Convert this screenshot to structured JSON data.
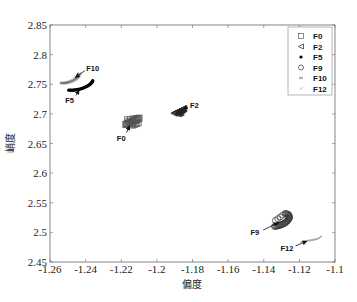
{
  "chart_data": {
    "type": "scatter",
    "title": "",
    "xlabel": "偏度",
    "ylabel": "峭度",
    "xlim": [
      -1.26,
      -1.1
    ],
    "ylim": [
      2.45,
      2.85
    ],
    "xticks": [
      "-1.26",
      "-1.24",
      "-1.22",
      "-1.2",
      "-1.18",
      "-1.16",
      "-1.14",
      "-1.12",
      "-1.1"
    ],
    "yticks": [
      "2.45",
      "2.5",
      "2.55",
      "2.6",
      "2.65",
      "2.7",
      "2.75",
      "2.8",
      "2.85"
    ],
    "grid": false,
    "legend_position": "upper right",
    "legend": [
      "F0",
      "F2",
      "F5",
      "F9",
      "F10",
      "F12"
    ],
    "series": [
      {
        "name": "F0",
        "marker": "square",
        "color": "#555555",
        "x": [
          -1.2175,
          -1.216,
          -1.2145,
          -1.213,
          -1.2115,
          -1.21,
          -1.2165,
          -1.2135,
          -1.2105
        ],
        "y": [
          2.682,
          2.684,
          2.686,
          2.688,
          2.69,
          2.693,
          2.69,
          2.681,
          2.685
        ]
      },
      {
        "name": "F2",
        "marker": "triangle-left",
        "color": "#222222",
        "x": [
          -1.1905,
          -1.189,
          -1.1875,
          -1.186,
          -1.1848,
          -1.1885,
          -1.1865
        ],
        "y": [
          2.701,
          2.703,
          2.705,
          2.707,
          2.709,
          2.7,
          2.702
        ]
      },
      {
        "name": "F5",
        "marker": "dot",
        "color": "#000000",
        "x": [
          -1.2495,
          -1.247,
          -1.245,
          -1.243,
          -1.241,
          -1.239,
          -1.2375,
          -1.2365,
          -1.236
        ],
        "y": [
          2.74,
          2.74,
          2.741,
          2.742,
          2.744,
          2.747,
          2.75,
          2.753,
          2.756
        ]
      },
      {
        "name": "F9",
        "marker": "circle",
        "color": "#333333",
        "x": [
          -1.134,
          -1.132,
          -1.13,
          -1.128,
          -1.1265,
          -1.1255,
          -1.126,
          -1.128,
          -1.1335
        ],
        "y": [
          2.51,
          2.511,
          2.513,
          2.516,
          2.52,
          2.525,
          2.53,
          2.532,
          2.52
        ]
      },
      {
        "name": "F10",
        "marker": "x-small",
        "color": "#777777",
        "x": [
          -1.2535,
          -1.252,
          -1.25,
          -1.248,
          -1.246,
          -1.2445,
          -1.2435
        ],
        "y": [
          2.752,
          2.752,
          2.753,
          2.755,
          2.758,
          2.762,
          2.768
        ]
      },
      {
        "name": "F12",
        "marker": "tick",
        "color": "#999999",
        "x": [
          -1.119,
          -1.117,
          -1.115,
          -1.113,
          -1.111,
          -1.109,
          -1.108
        ],
        "y": [
          2.484,
          2.485,
          2.486,
          2.487,
          2.488,
          2.49,
          2.493
        ]
      }
    ],
    "annotations": [
      {
        "text": "F10",
        "x": -1.236,
        "y": 2.778
      },
      {
        "text": "F5",
        "x": -1.249,
        "y": 2.724
      },
      {
        "text": "F0",
        "x": -1.22,
        "y": 2.66
      },
      {
        "text": "F2",
        "x": -1.179,
        "y": 2.715
      },
      {
        "text": "F9",
        "x": -1.145,
        "y": 2.5
      },
      {
        "text": "F12",
        "x": -1.127,
        "y": 2.474
      }
    ]
  }
}
